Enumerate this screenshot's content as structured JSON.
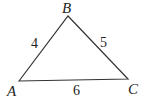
{
  "diagram": {
    "type": "triangle",
    "vertices": [
      {
        "name": "A",
        "label": "A"
      },
      {
        "name": "B",
        "label": "B"
      },
      {
        "name": "C",
        "label": "C"
      }
    ],
    "sides": [
      {
        "between": "AB",
        "label": "4"
      },
      {
        "between": "BC",
        "label": "5"
      },
      {
        "between": "AC",
        "label": "6"
      }
    ],
    "stroke_color": "#333333"
  }
}
